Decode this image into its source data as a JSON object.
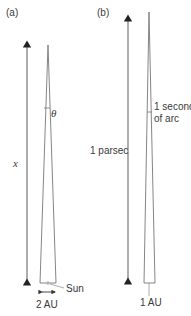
{
  "panels": [
    {
      "id": "a",
      "label": "(a)",
      "distance_label": "x",
      "angle_label": "θ",
      "object_label": "Sun",
      "baseline_label": "2 AU"
    },
    {
      "id": "b",
      "label": "(b)",
      "distance_label": "1 parsec",
      "angle_label_line1": "1 second",
      "angle_label_line2": "of arc",
      "baseline_label": "1 AU"
    }
  ],
  "colors": {
    "line": "#6e6e6e",
    "arrow": "#222222",
    "text": "#3a3a3a",
    "sun": "#b5b5b5"
  }
}
